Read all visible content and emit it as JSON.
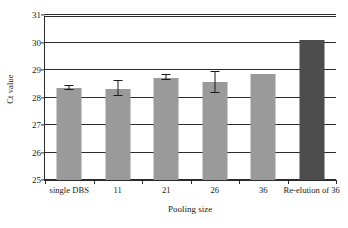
{
  "chart_data": {
    "type": "bar",
    "title": "",
    "xlabel": "Pooling size",
    "ylabel": "Ct value",
    "ylim": [
      25,
      31
    ],
    "ytick_labels": [
      "31",
      "30",
      "29",
      "28",
      "27",
      "26",
      "25"
    ],
    "yticks": [
      31,
      30,
      29,
      28,
      27,
      26,
      25
    ],
    "grid": true,
    "legend": "none",
    "categories": [
      "single DBS",
      "11",
      "21",
      "26",
      "36",
      "Re-elution of 36"
    ],
    "values": [
      28.35,
      28.32,
      28.72,
      28.55,
      28.85,
      30.1
    ],
    "errors": [
      0.06,
      0.28,
      0.09,
      0.37,
      0.0,
      0.0
    ],
    "bar_colors": [
      "#9a9a9a",
      "#9a9a9a",
      "#9a9a9a",
      "#9a9a9a",
      "#9a9a9a",
      "#4d4d4d"
    ],
    "series": [
      {
        "name": "Ct value",
        "values": [
          28.35,
          28.32,
          28.72,
          28.55,
          28.85,
          30.1
        ],
        "errors": [
          0.06,
          0.28,
          0.09,
          0.37,
          0.0,
          0.0
        ]
      }
    ]
  },
  "colors": {
    "bar_light": "#9a9a9a",
    "bar_dark": "#4d4d4d",
    "axis": "#2b2b2b",
    "background": "#ffffff"
  }
}
